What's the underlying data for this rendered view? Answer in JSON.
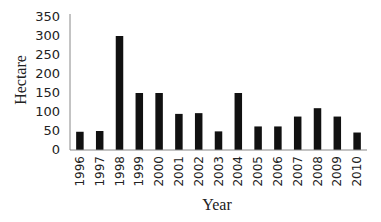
{
  "chart_data": {
    "type": "bar",
    "title": "",
    "xlabel": "Year",
    "ylabel": "Hectare",
    "categories": [
      "1996",
      "1997",
      "1998",
      "1999",
      "2000",
      "2001",
      "2002",
      "2003",
      "2004",
      "2005",
      "2006",
      "2007",
      "2008",
      "2009",
      "2010"
    ],
    "values": [
      48,
      50,
      300,
      150,
      150,
      95,
      97,
      49,
      150,
      62,
      62,
      88,
      110,
      88,
      46
    ],
    "ylim": [
      0,
      350
    ],
    "yticks": [
      0,
      50,
      100,
      150,
      200,
      250,
      300,
      350
    ],
    "grid": false,
    "legend": null,
    "bar_color": "#111111",
    "axis_color": "#888888"
  }
}
